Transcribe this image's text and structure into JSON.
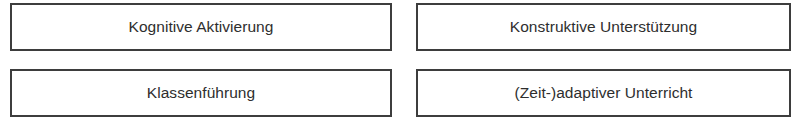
{
  "diagram": {
    "layout": "2x2 grid of labeled boxes",
    "border_color": "#3d3d3d",
    "text_color": "#2e2e2e",
    "boxes": [
      {
        "label": "Kognitive Aktivierung"
      },
      {
        "label": "Konstruktive Unterstützung"
      },
      {
        "label": "Klassenführung"
      },
      {
        "label": "(Zeit-)adaptiver Unterricht"
      }
    ]
  }
}
